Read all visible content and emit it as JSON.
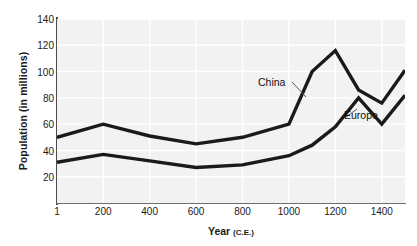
{
  "chart_data": {
    "type": "line",
    "title": "",
    "xlabel": "Year (C.E.)",
    "xlabel_main": "Year",
    "xlabel_suffix": "(C.E.)",
    "ylabel": "Population (in millions)",
    "xlim": [
      1,
      1500
    ],
    "ylim": [
      0,
      140
    ],
    "xticks": [
      "1",
      "200",
      "400",
      "600",
      "800",
      "1000",
      "1200",
      "1400"
    ],
    "xtick_values": [
      1,
      200,
      400,
      600,
      800,
      1000,
      1200,
      1400
    ],
    "yticks": [
      "20",
      "40",
      "60",
      "80",
      "100",
      "120",
      "140"
    ],
    "ytick_values": [
      20,
      40,
      60,
      80,
      100,
      120,
      140
    ],
    "grid": true,
    "grid_color": "#ffffff",
    "plot_background": "#f2f2f2",
    "line_color": "#1a1a1a",
    "legend_position": "inline-annotation",
    "x": [
      1,
      200,
      400,
      600,
      800,
      1000,
      1100,
      1200,
      1300,
      1400,
      1500
    ],
    "series": [
      {
        "name": "China",
        "values": [
          50,
          60,
          51,
          45,
          50,
          60,
          100,
          116,
          86,
          76,
          101
        ]
      },
      {
        "name": "Europe",
        "values": [
          31,
          37,
          32,
          27,
          29,
          36,
          44,
          58,
          80,
          60,
          82
        ]
      }
    ]
  },
  "annotations": {
    "china_label": "China",
    "europe_label": "Europe"
  }
}
